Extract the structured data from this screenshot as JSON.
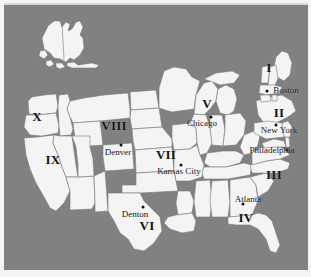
{
  "figure": {
    "kind": "map",
    "background_color": "#818181",
    "land_color": "#f4f4f4",
    "border_color": "#7a7a7a",
    "paper_color": "#f4f4f4"
  },
  "regions": [
    {
      "numeral": "I",
      "x": 265,
      "y": 63
    },
    {
      "numeral": "II",
      "x": 275,
      "y": 108
    },
    {
      "numeral": "III",
      "x": 270,
      "y": 170
    },
    {
      "numeral": "IV",
      "x": 242,
      "y": 213
    },
    {
      "numeral": "V",
      "x": 203,
      "y": 99
    },
    {
      "numeral": "VI",
      "x": 143,
      "y": 221
    },
    {
      "numeral": "VII",
      "x": 162,
      "y": 150
    },
    {
      "numeral": "VIII",
      "x": 110,
      "y": 121
    },
    {
      "numeral": "IX",
      "x": 49,
      "y": 155
    },
    {
      "numeral": "X",
      "x": 33,
      "y": 112
    }
  ],
  "cities": [
    {
      "name": "Boston",
      "label_x": 282,
      "label_y": 85,
      "dot_x": 263,
      "dot_y": 86
    },
    {
      "name": "New York",
      "label_x": 275,
      "label_y": 125,
      "dot_x": 272,
      "dot_y": 120
    },
    {
      "name": "Philadelphia",
      "label_x": 268,
      "label_y": 145,
      "dot_x": 283,
      "dot_y": 145
    },
    {
      "name": "Atlanta",
      "label_x": 244,
      "label_y": 194,
      "dot_x": 239,
      "dot_y": 199
    },
    {
      "name": "Chicago",
      "label_x": 198,
      "label_y": 118,
      "dot_x": 207,
      "dot_y": 112
    },
    {
      "name": "Kansas City",
      "label_x": 175,
      "label_y": 166,
      "dot_x": 177,
      "dot_y": 160
    },
    {
      "name": "Denver",
      "label_x": 114,
      "label_y": 147,
      "dot_x": 117,
      "dot_y": 140
    },
    {
      "name": "Denton",
      "label_x": 131,
      "label_y": 209,
      "dot_x": 139,
      "dot_y": 202
    }
  ]
}
